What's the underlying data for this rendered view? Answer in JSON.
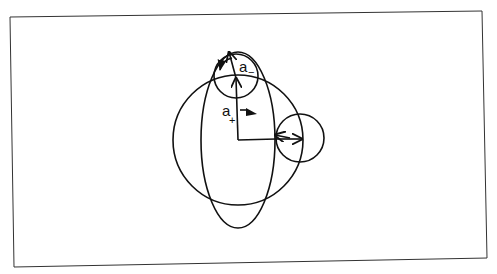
{
  "diagram": {
    "labels": {
      "a_minus": {
        "base": "a",
        "subscript": "−"
      },
      "a_plus": {
        "base": "a",
        "subscript": "+"
      }
    },
    "shapes": {
      "frame": {
        "points": [
          [
            10,
            17
          ],
          [
            482,
            11
          ],
          [
            487,
            258
          ],
          [
            14,
            267
          ]
        ]
      },
      "large_circle": {
        "cx": 238,
        "cy": 140,
        "r": 65
      },
      "ellipse": {
        "cx": 238,
        "cy": 140,
        "rx": 37,
        "ry": 88
      },
      "top_circle": {
        "cx": 236,
        "cy": 76,
        "r": 22
      },
      "right_circle": {
        "cx": 300,
        "cy": 138,
        "r": 24
      }
    },
    "colors": {
      "stroke": "#111111",
      "background": "#ffffff"
    }
  }
}
